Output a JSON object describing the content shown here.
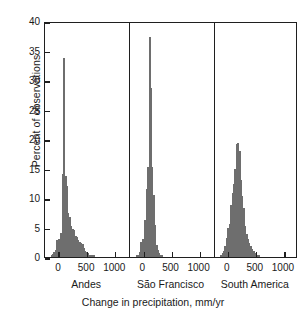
{
  "chart_data": {
    "type": "bar",
    "title": "",
    "subtitle": "",
    "xlabel": "Change in precipitation, mm/yr",
    "ylabel": "Percent of observations",
    "ylim": [
      0,
      40
    ],
    "yticks": [
      0,
      5,
      10,
      15,
      20,
      25,
      30,
      35,
      40
    ],
    "xlim": [
      -250,
      1250
    ],
    "xticks": [
      0,
      500,
      1000
    ],
    "xticklabels": [
      "0",
      "500",
      "1000"
    ],
    "grid": false,
    "legend": null,
    "bin_width": 25,
    "panels": [
      {
        "name": "Andes",
        "label": "Andes",
        "bins": [
          -150,
          -125,
          -100,
          -75,
          -50,
          -25,
          0,
          25,
          50,
          75,
          100,
          125,
          150,
          175,
          200,
          225,
          250,
          275,
          300,
          325,
          350,
          375,
          400,
          425,
          450,
          475,
          500,
          525,
          550,
          575,
          600
        ],
        "values": [
          0.3,
          0.5,
          0.8,
          1.2,
          2.8,
          3.0,
          2.6,
          4.0,
          14.0,
          33.7,
          13.8,
          12.0,
          7.4,
          6.8,
          5.2,
          4.8,
          4.5,
          3.6,
          3.4,
          2.9,
          2.6,
          2.4,
          2.2,
          1.6,
          1.1,
          0.9,
          0.7,
          0.4,
          0.3,
          0.2,
          0.1
        ]
      },
      {
        "name": "São Francisco",
        "label": "São Francisco",
        "bins": [
          -150,
          -125,
          -100,
          -75,
          -50,
          -25,
          0,
          25,
          50,
          75,
          100,
          125,
          150,
          175,
          200,
          225,
          250,
          275,
          300
        ],
        "values": [
          0.2,
          0.4,
          0.8,
          2.6,
          3.0,
          2.9,
          6.2,
          11.5,
          15.3,
          37.3,
          28.6,
          15.2,
          10.5,
          5.4,
          2.0,
          1.2,
          0.6,
          0.3,
          0.1
        ]
      },
      {
        "name": "South America",
        "label": "South America",
        "bins": [
          -150,
          -125,
          -100,
          -75,
          -50,
          -25,
          0,
          25,
          50,
          75,
          100,
          125,
          150,
          175,
          200,
          225,
          250,
          275,
          300,
          325,
          350,
          375,
          400,
          425,
          450,
          475,
          500,
          525
        ],
        "values": [
          0.3,
          0.6,
          1.1,
          1.8,
          3.3,
          5.0,
          5.6,
          8.8,
          10.8,
          12.3,
          15.0,
          19.1,
          19.4,
          18.0,
          13.0,
          10.4,
          8.3,
          5.2,
          3.9,
          3.0,
          2.4,
          1.9,
          1.4,
          1.0,
          0.7,
          0.4,
          0.3,
          0.2
        ]
      }
    ],
    "colors": {
      "bar_fill": "#c9c9c9",
      "bar_edge": "#6e6e6e",
      "axis": "#1f1f1f",
      "background": "#ffffff"
    }
  }
}
